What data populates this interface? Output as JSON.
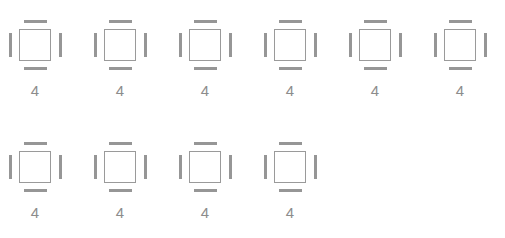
{
  "canvas": {
    "width": 505,
    "height": 238,
    "background_color": "#ffffff"
  },
  "style": {
    "outline_color": "#9a9a9a",
    "seat_color": "#969696",
    "label_color": "#8c8c8c"
  },
  "icon": {
    "semantic_name": "table-with-four-seats-icon",
    "seat_names": [
      "seat-top",
      "seat-right",
      "seat-bottom",
      "seat-left"
    ]
  },
  "rows": [
    {
      "row_index": 1,
      "tables": [
        {
          "capacity": "4"
        },
        {
          "capacity": "4"
        },
        {
          "capacity": "4"
        },
        {
          "capacity": "4"
        },
        {
          "capacity": "4"
        },
        {
          "capacity": "4"
        }
      ]
    },
    {
      "row_index": 2,
      "tables": [
        {
          "capacity": "4"
        },
        {
          "capacity": "4"
        },
        {
          "capacity": "4"
        },
        {
          "capacity": "4"
        }
      ]
    }
  ]
}
